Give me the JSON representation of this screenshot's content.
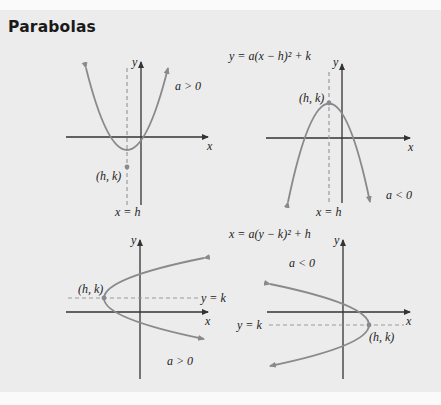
{
  "title": "Parabolas",
  "diagrams": {
    "vertical": {
      "equation": "y = a(x − h)² + k",
      "opens_up": {
        "condition": "a > 0",
        "vertex_label": "(h, k)",
        "axis_label": "x = h",
        "x_axis_label": "x",
        "y_axis_label": "y"
      },
      "opens_down": {
        "condition": "a < 0",
        "vertex_label": "(h, k)",
        "axis_label": "x = h",
        "x_axis_label": "x",
        "y_axis_label": "y"
      }
    },
    "horizontal": {
      "equation": "x = a(y − k)² + h",
      "opens_right": {
        "condition": "a > 0",
        "vertex_label": "(h, k)",
        "axis_label": "y = k",
        "x_axis_label": "x",
        "y_axis_label": "y"
      },
      "opens_left": {
        "condition": "a < 0",
        "vertex_label": "(h, k)",
        "axis_label": "y = k",
        "x_axis_label": "x",
        "y_axis_label": "y"
      }
    }
  },
  "colors": {
    "curve": "#8a8a8e",
    "axis": "#333333",
    "background": "#ececec"
  }
}
